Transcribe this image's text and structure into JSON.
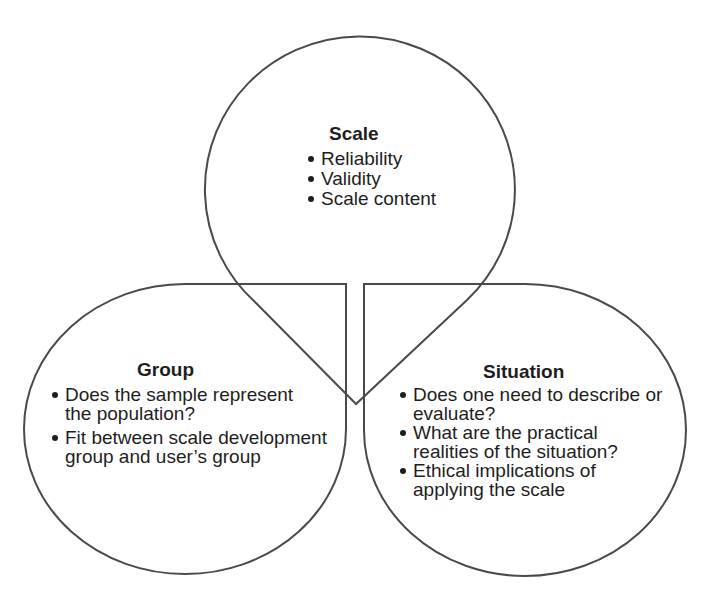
{
  "diagram": {
    "type": "three-lobe concept diagram",
    "stroke_color": "#4a4a4a",
    "text_color": "#1e1e1e",
    "nodes": [
      {
        "id": "scale",
        "title": "Scale",
        "position": "top",
        "items": [
          "Reliability",
          "Validity",
          "Scale content"
        ]
      },
      {
        "id": "group",
        "title": "Group",
        "position": "bottom-left",
        "items": [
          "Does the sample represent\nthe population?",
          "Fit between scale development\ngroup and user’s group"
        ]
      },
      {
        "id": "situation",
        "title": "Situation",
        "position": "bottom-right",
        "items": [
          "Does one need to describe or\nevaluate?",
          "What are the practical\nrealities of the situation?",
          "Ethical implications of\napplying the scale"
        ]
      }
    ]
  },
  "scale": {
    "title": "Scale",
    "items": [
      "Reliability",
      "Validity",
      "Scale content"
    ]
  },
  "group": {
    "title": "Group",
    "items": [
      "Does the sample represent\nthe population?",
      "Fit between scale development\ngroup and user’s group"
    ]
  },
  "situation": {
    "title": "Situation",
    "items": [
      "Does one need to describe or\nevaluate?",
      "What are the practical\nrealities of the situation?",
      "Ethical implications of\napplying the scale"
    ]
  }
}
